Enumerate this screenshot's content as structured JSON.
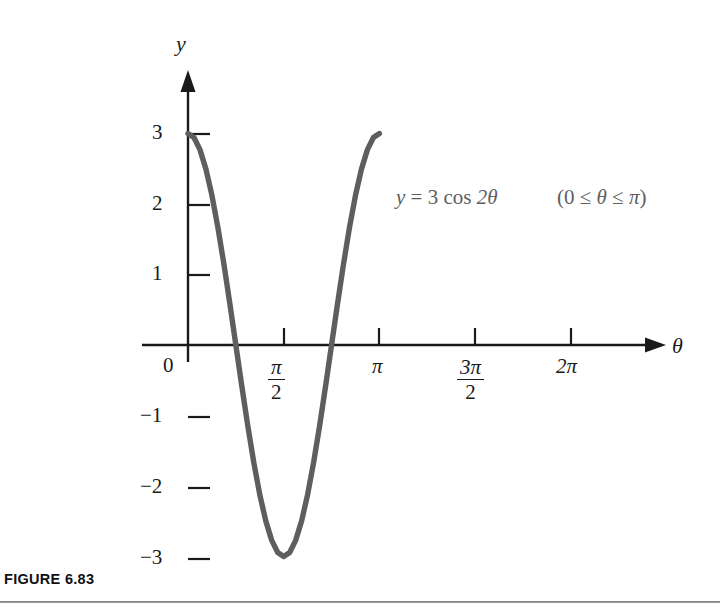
{
  "figure": {
    "caption": "FIGURE 6.83",
    "background_color": "#ffffff",
    "curve_color": "#5e5e5e",
    "axis_color": "#1a1a1a"
  },
  "axes": {
    "y_axis_label": "y",
    "x_axis_label": "θ",
    "origin_label": "0",
    "y_ticks": [
      {
        "value": 3,
        "label": "3"
      },
      {
        "value": 2,
        "label": "2"
      },
      {
        "value": 1,
        "label": "1"
      },
      {
        "value": -1,
        "label": "−1"
      },
      {
        "value": -2,
        "label": "−2"
      },
      {
        "value": -3,
        "label": "−3"
      }
    ],
    "x_ticks": [
      {
        "value": 1.5707963,
        "label": "π/2",
        "numerator": "π",
        "denominator": "2",
        "is_fraction": true
      },
      {
        "value": 3.1415927,
        "label": "π",
        "numerator": "",
        "denominator": "",
        "is_fraction": false
      },
      {
        "value": 4.712389,
        "label": "3π/2",
        "numerator": "3π",
        "denominator": "2",
        "is_fraction": true
      },
      {
        "value": 6.2831853,
        "label": "2π",
        "numerator": "",
        "denominator": "",
        "is_fraction": false
      }
    ]
  },
  "annotations": {
    "equation_lhs": "y",
    "equation_eq": "=",
    "equation_rhs_coefficient": "3",
    "equation_function": "cos",
    "equation_argument": "2θ",
    "equation_full": "y = 3 cos 2θ",
    "domain_open": "(",
    "domain_lower": "0",
    "domain_rel1": "≤",
    "domain_var": "θ",
    "domain_rel2": "≤",
    "domain_upper": "π",
    "domain_close": ")",
    "domain_full": "(0 ≤ θ ≤ π)"
  },
  "chart_data": {
    "type": "line",
    "title": "",
    "subtitle": "",
    "xlabel": "θ",
    "ylabel": "y",
    "function": "y = 3 cos 2θ",
    "amplitude": 3,
    "period": 3.1415927,
    "domain": [
      0,
      3.1415927
    ],
    "xlim": [
      0,
      6.8
    ],
    "ylim": [
      -3.4,
      3.4
    ],
    "grid": false,
    "legend": "none",
    "xtick_values": [
      0,
      1.5707963,
      3.1415927,
      4.712389,
      6.2831853
    ],
    "xtick_labels": [
      "0",
      "π/2",
      "π",
      "3π/2",
      "2π"
    ],
    "ytick_values": [
      3,
      2,
      1,
      0,
      -1,
      -2,
      -3
    ],
    "ytick_labels": [
      "3",
      "2",
      "1",
      "0",
      "−1",
      "−2",
      "−3"
    ],
    "annotations": [
      "y = 3 cos 2θ",
      "(0 ≤ θ ≤ π)"
    ],
    "key_points": [
      {
        "x": 0,
        "y": 3,
        "note": "maximum at start of domain"
      },
      {
        "x": 0.7853982,
        "y": 0,
        "note": "zero crossing at π/4"
      },
      {
        "x": 1.5707963,
        "y": -3,
        "note": "minimum at π/2"
      },
      {
        "x": 2.3561945,
        "y": 0,
        "note": "zero crossing at 3π/4"
      },
      {
        "x": 3.1415927,
        "y": 3,
        "note": "maximum at end of domain"
      }
    ],
    "series": [
      {
        "name": "y = 3 cos 2θ",
        "color": "#5e5e5e",
        "x": [
          0,
          0.0981748,
          0.1963495,
          0.2945243,
          0.3926991,
          0.4908739,
          0.5890486,
          0.6872234,
          0.7853982,
          0.8835729,
          0.9817477,
          1.0799225,
          1.1780972,
          1.276272,
          1.3744468,
          1.4726216,
          1.5707963,
          1.6689711,
          1.7671459,
          1.8653206,
          1.9634954,
          2.0616702,
          2.159845,
          2.2580197,
          2.3561945,
          2.4543693,
          2.552544,
          2.6507188,
          2.7488936,
          2.8470684,
          2.9452431,
          3.0434179,
          3.1415927
        ],
        "y": [
          3.0,
          2.9423558,
          2.7716386,
          2.4944088,
          2.1213203,
          1.6667107,
          1.1480503,
          0.5852709,
          0.0,
          -0.5852709,
          -1.1480503,
          -1.6667107,
          -2.1213203,
          -2.4944088,
          -2.7716386,
          -2.9423558,
          -3.0,
          -2.9423558,
          -2.7716386,
          -2.4944088,
          -2.1213203,
          -1.6667107,
          -1.1480503,
          -0.5852709,
          0.0,
          0.5852709,
          1.1480503,
          1.6667107,
          2.1213203,
          2.4944088,
          2.7716386,
          2.9423558,
          3.0
        ]
      }
    ]
  }
}
